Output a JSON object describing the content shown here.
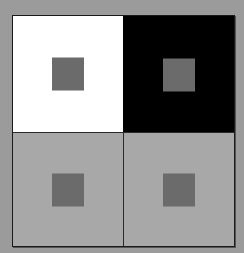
{
  "figure": {
    "type": "simultaneous-contrast-illusion",
    "background_color": "#9b9b9b",
    "border_color": "#1a1a1a",
    "quadrants": [
      {
        "position": "top-left",
        "background": "#ffffff",
        "inner_square": "#6b6b6b"
      },
      {
        "position": "top-right",
        "background": "#000000",
        "inner_square": "#6b6b6b"
      },
      {
        "position": "bottom-left",
        "background": "#a8a8a8",
        "inner_square": "#6b6b6b"
      },
      {
        "position": "bottom-right",
        "background": "#a8a8a8",
        "inner_square": "#6b6b6b"
      }
    ]
  }
}
